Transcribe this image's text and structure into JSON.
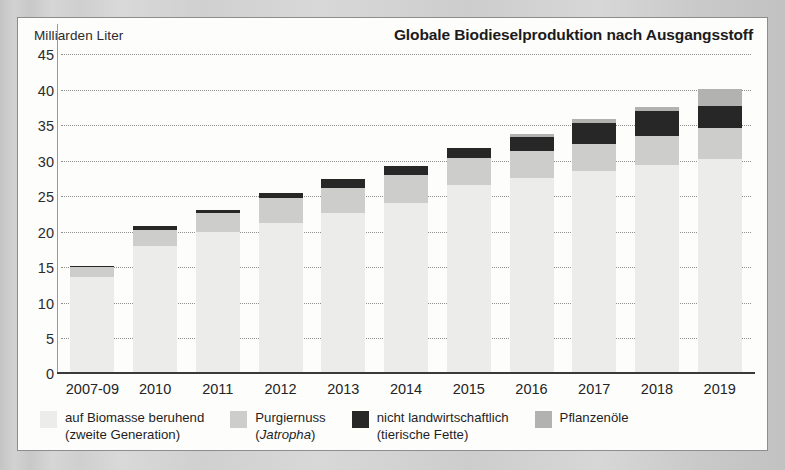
{
  "header": {
    "y_unit_label": "Milliarden Liter",
    "title": "Globale Biodieselproduktion nach Ausgangsstoff"
  },
  "legend": {
    "items": [
      {
        "label_line1": "auf Biomasse beruhend",
        "label_line2": "(zweite Generation)",
        "color": "#ececeb",
        "swatch_name": "legend-swatch-biomass"
      },
      {
        "label_line1": "Purgiernuss",
        "label_line2": "(Jatropha)",
        "label_line2_italic": "Jatropha",
        "color": "#cdcdcb",
        "swatch_name": "legend-swatch-jatropha"
      },
      {
        "label_line1": "nicht landwirtschaftlich",
        "label_line2": "(tierische Fette)",
        "color": "#272727",
        "swatch_name": "legend-swatch-animal-fats"
      },
      {
        "label_line1": "Pflanzenöle",
        "label_line2": "",
        "color": "#b2b2b0",
        "swatch_name": "legend-swatch-vegetable-oils"
      }
    ]
  },
  "chart_data": {
    "type": "bar",
    "subtype": "stacked-bar",
    "title": "Globale Biodieselproduktion nach Ausgangsstoff",
    "xlabel": "",
    "ylabel": "Milliarden Liter",
    "ylim": [
      0,
      45
    ],
    "yticks": [
      0,
      5,
      10,
      15,
      20,
      25,
      30,
      35,
      40,
      45
    ],
    "ytick_labels": [
      "0",
      "5",
      "10",
      "15",
      "20",
      "25",
      "30",
      "35",
      "40",
      "45"
    ],
    "grid": true,
    "grid_style": "dotted-horizontal",
    "legend_position": "bottom",
    "categories": [
      "2007-09",
      "2010",
      "2011",
      "2012",
      "2013",
      "2014",
      "2015",
      "2016",
      "2017",
      "2018",
      "2019"
    ],
    "stack_order_bottom_to_top": [
      "auf Biomasse beruhend (zweite Generation)",
      "Purgiernuss (Jatropha)",
      "nicht landwirtschaftlich (tierische Fette)",
      "Pflanzenöle"
    ],
    "series": [
      {
        "name": "auf Biomasse beruhend (zweite Generation)",
        "color": "#ececeb",
        "values": [
          13.7,
          18.0,
          20.0,
          21.2,
          22.6,
          24.1,
          26.6,
          27.5,
          28.6,
          29.4,
          30.2
        ]
      },
      {
        "name": "Purgiernuss (Jatropha)",
        "color": "#cdcdcb",
        "values": [
          1.3,
          2.3,
          2.6,
          3.6,
          3.6,
          3.9,
          3.8,
          3.9,
          3.7,
          4.1,
          4.4
        ]
      },
      {
        "name": "nicht landwirtschaftlich (tierische Fette)",
        "color": "#272727",
        "values": [
          0.2,
          0.5,
          0.5,
          0.7,
          1.2,
          1.2,
          1.4,
          1.9,
          3.0,
          3.5,
          3.1
        ]
      },
      {
        "name": "Pflanzenöle",
        "color": "#b2b2b0",
        "values": [
          0.0,
          0.0,
          0.0,
          0.0,
          0.0,
          0.0,
          0.0,
          0.4,
          0.6,
          0.5,
          2.4
        ]
      }
    ],
    "totals": [
      15.2,
      20.8,
      23.1,
      25.5,
      27.4,
      29.2,
      31.8,
      33.7,
      35.9,
      37.5,
      40.1
    ]
  }
}
